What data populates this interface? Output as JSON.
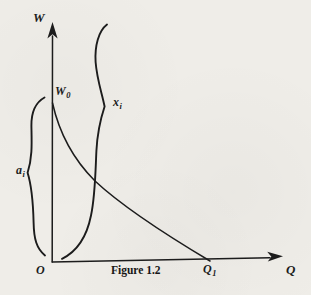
{
  "colors": {
    "ink": "#1c1c1c",
    "paper": "#efede8"
  },
  "caption": "Figure 1.2",
  "labels": {
    "w_axis": "W",
    "w0": {
      "base": "W",
      "sub": "0"
    },
    "xi": {
      "base": "x",
      "sub": "i"
    },
    "ai": {
      "base": "a",
      "sub": "i"
    },
    "origin": "O",
    "q1": {
      "base": "Q",
      "sub": "1"
    },
    "q_axis": "Q"
  }
}
